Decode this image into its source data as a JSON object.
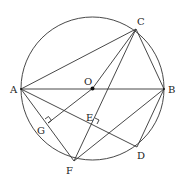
{
  "diagram": {
    "type": "circle-geometry",
    "center_label": "O",
    "points": {
      "A": {
        "label": "A"
      },
      "B": {
        "label": "B"
      },
      "C": {
        "label": "C"
      },
      "D": {
        "label": "D"
      },
      "E": {
        "label": "E"
      },
      "F": {
        "label": "F"
      },
      "G": {
        "label": "G"
      },
      "O": {
        "label": "O"
      }
    },
    "segments": [
      "AB",
      "AC",
      "BC",
      "AF",
      "AD",
      "CF",
      "BF",
      "BD",
      "OG"
    ],
    "right_angles": [
      "G",
      "E"
    ],
    "colors": {
      "stroke": "#333333",
      "text": "#222222",
      "background": "#ffffff"
    }
  }
}
